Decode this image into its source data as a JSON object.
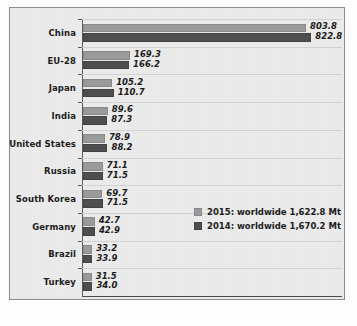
{
  "chart_data": {
    "type": "bar",
    "orientation": "horizontal",
    "title": "",
    "xlabel": "",
    "ylabel": "",
    "xlim": [
      0,
      840
    ],
    "grid": true,
    "legend_position": "inside-right-middle",
    "units": "Mt",
    "categories": [
      "China",
      "EU-28",
      "Japan",
      "India",
      "United States",
      "Russia",
      "South Korea",
      "Germany",
      "Brazil",
      "Turkey"
    ],
    "series": [
      {
        "name": "2015: worldwide 1,622.8 Mt",
        "short_name": "2015",
        "color": "#9a9a9a",
        "values": [
          803.8,
          169.3,
          105.2,
          89.6,
          78.9,
          71.1,
          69.7,
          42.7,
          33.2,
          31.5
        ],
        "labels": [
          "803.8",
          "169.3",
          "105.2",
          "89.6",
          "78.9",
          "71.1",
          "69.7",
          "42.7",
          "33.2",
          "31.5"
        ]
      },
      {
        "name": "2014: worldwide 1,670.2 Mt",
        "short_name": "2014",
        "color": "#4e4e4e",
        "values": [
          822.8,
          166.2,
          110.7,
          87.3,
          88.2,
          71.5,
          71.5,
          42.9,
          33.9,
          34.0
        ],
        "labels": [
          "822.8",
          "166.2",
          "110.7",
          "87.3",
          "88.2",
          "71.5",
          "71.5",
          "42.9",
          "33.9",
          "34.0"
        ]
      }
    ],
    "worldwide_totals": {
      "2015": "1,622.8 Mt",
      "2014": "1,670.2 Mt"
    }
  },
  "legend": {
    "entries": [
      {
        "label": "2015: worldwide 1,622.8 Mt",
        "swatch": "light-gray-swatch"
      },
      {
        "label": "2014: worldwide 1,670.2 Mt",
        "swatch": "dark-gray-swatch"
      }
    ]
  },
  "colors": {
    "series_2015": "#9a9a9a",
    "series_2014": "#4e4e4e",
    "panel_background": "#ececec",
    "panel_border": "#8c8c8c",
    "axis": "#5a5a5a",
    "gridline": "#d2d2d2",
    "text": "#1c1c1c"
  }
}
